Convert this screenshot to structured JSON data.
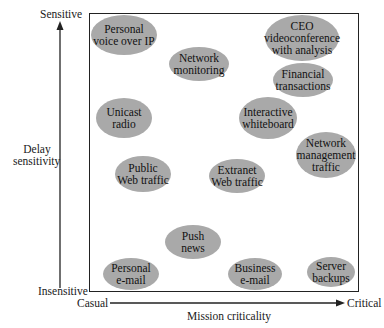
{
  "y_axis": {
    "top_label": "Sensitive",
    "bottom_label": "Insensitive",
    "title_line1": "Delay",
    "title_line2": "sensitivity"
  },
  "x_axis": {
    "left_label": "Casual",
    "right_label": "Critical",
    "title": "Mission criticality"
  },
  "colors": {
    "bubble_fill": "#a9a9a9",
    "axis_line": "#222222"
  },
  "bubbles": [
    {
      "label": "Personal\nvoice over IP",
      "cx": 124,
      "cy": 35,
      "rx": 33,
      "ry": 20
    },
    {
      "label": "Network\nmonitoring",
      "cx": 199,
      "cy": 64,
      "rx": 30,
      "ry": 17
    },
    {
      "label": "CEO\nvideoconference\nwith analysis",
      "cx": 302,
      "cy": 38,
      "rx": 37,
      "ry": 23
    },
    {
      "label": "Financial\ntransactions",
      "cx": 303,
      "cy": 80,
      "rx": 30,
      "ry": 17
    },
    {
      "label": "Unicast\nradio",
      "cx": 124,
      "cy": 118,
      "rx": 28,
      "ry": 20
    },
    {
      "label": "Interactive\nwhiteboard",
      "cx": 268,
      "cy": 118,
      "rx": 29,
      "ry": 21
    },
    {
      "label": "Network\nmanagement\ntraffic",
      "cx": 326,
      "cy": 155,
      "rx": 30,
      "ry": 23
    },
    {
      "label": "Public\nWeb traffic",
      "cx": 143,
      "cy": 174,
      "rx": 28,
      "ry": 18
    },
    {
      "label": "Extranet\nWeb traffic",
      "cx": 237,
      "cy": 176,
      "rx": 28,
      "ry": 17
    },
    {
      "label": "Push\nnews",
      "cx": 193,
      "cy": 242,
      "rx": 28,
      "ry": 17
    },
    {
      "label": "Personal\ne-mail",
      "cx": 131,
      "cy": 274,
      "rx": 28,
      "ry": 16
    },
    {
      "label": "Business\ne-mail",
      "cx": 255,
      "cy": 274,
      "rx": 27,
      "ry": 16
    },
    {
      "label": "Server\nbackups",
      "cx": 331,
      "cy": 272,
      "rx": 24,
      "ry": 15
    }
  ]
}
